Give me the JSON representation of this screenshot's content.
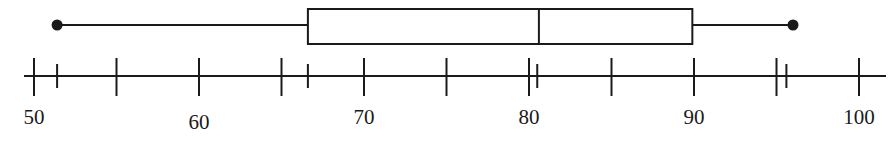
{
  "chart_data": {
    "type": "boxplot",
    "title": "",
    "xlabel": "",
    "ylabel": "",
    "xlim": [
      49.4,
      101.6
    ],
    "grid": false,
    "legend": null,
    "five_number_summary": {
      "min": 51.4,
      "q1": 66.6,
      "median": 80.6,
      "q3": 89.9,
      "max": 96.0
    },
    "major_ticks": [
      50,
      55,
      60,
      65,
      70,
      75,
      80,
      85,
      90,
      95,
      100
    ],
    "tick_labels": [
      "50",
      "60",
      "70",
      "80",
      "90",
      "100"
    ],
    "labeled_tick_values": [
      50,
      60,
      70,
      80,
      90,
      100
    ],
    "marker_ticks": [
      51.4,
      66.6,
      80.5,
      95.6
    ],
    "colors": {
      "line": "#1a1a1a",
      "box_fill": "#ffffff",
      "background": "#ffffff"
    }
  }
}
